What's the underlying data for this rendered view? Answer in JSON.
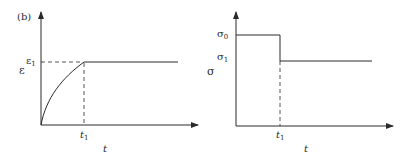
{
  "panel_label": "(b)",
  "left_plot": {
    "title": "strain vs time",
    "y_label": "ε",
    "y_level_label": "ε",
    "y_level_sub": "1",
    "x_tick_label": "t",
    "x_tick_sub": "1",
    "x_label": "t",
    "description": "Strain rises along a concave curve from origin to ε1 at t1, then stays constant"
  },
  "right_plot": {
    "title": "stress vs time",
    "y_label": "σ",
    "level0_label": "σ",
    "level0_sub": "0",
    "level1_label": "σ",
    "level1_sub": "1",
    "x_tick_label": "t",
    "x_tick_sub": "1",
    "x_label": "t",
    "description": "Stress is constant at σ0 until t1, then drops to σ1 and stays constant"
  },
  "colors": {
    "line": "#2a2a2a",
    "background": "#ffffff"
  }
}
